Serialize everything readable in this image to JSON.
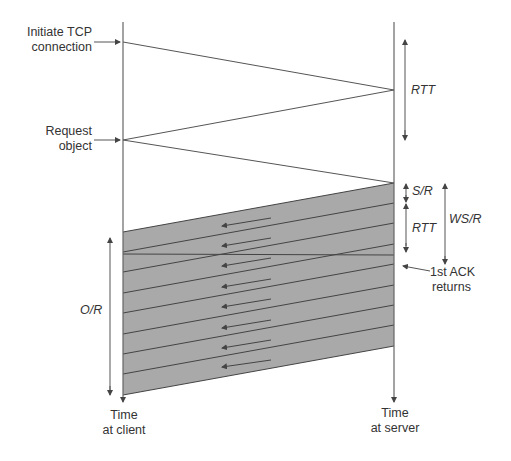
{
  "diagram": {
    "labels": {
      "initiate_tcp": [
        "Initiate TCP",
        "connection"
      ],
      "request_object": [
        "Request",
        "object"
      ],
      "rtt_top": "RTT",
      "s_over_r": "S/R",
      "rtt_mid": "RTT",
      "ws_over_r": "WS/R",
      "first_ack": [
        "1st ACK",
        "returns"
      ],
      "o_over_r": "O/R",
      "time_client": [
        "Time",
        "at client"
      ],
      "time_server": [
        "Time",
        "at server"
      ]
    },
    "timelines": {
      "client_x": 123,
      "server_x": 394,
      "top_y": 22,
      "bottom_y": 400
    },
    "messages": [
      {
        "from": "client",
        "to": "server",
        "y_start": 42,
        "y_end": 90,
        "name": "SYN"
      },
      {
        "from": "server",
        "to": "client",
        "y_start": 90,
        "y_end": 140,
        "name": "SYN-ACK"
      },
      {
        "from": "client",
        "to": "server",
        "y_start": 140,
        "y_end": 183,
        "name": "request"
      }
    ],
    "shaded_band": {
      "color": "#a9a9a9",
      "top_left": [
        123,
        232
      ],
      "top_right": [
        394,
        183
      ],
      "bottom_right": [
        394,
        346
      ],
      "bottom_left": [
        123,
        395
      ],
      "segment_count": 8
    },
    "colors": {
      "line": "#555555",
      "shade": "#a9a9a9",
      "text": "#333333"
    }
  }
}
